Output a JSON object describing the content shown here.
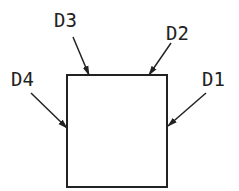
{
  "diagram": {
    "box": {
      "x": 67,
      "y": 75,
      "width": 100,
      "height": 112
    },
    "stroke_color": "#222222",
    "labels": [
      {
        "id": "D1",
        "text": "D1",
        "x": 202,
        "y": 86
      },
      {
        "id": "D2",
        "text": "D2",
        "x": 166,
        "y": 40
      },
      {
        "id": "D3",
        "text": "D3",
        "x": 54,
        "y": 27
      },
      {
        "id": "D4",
        "text": "D4",
        "x": 11,
        "y": 86
      }
    ],
    "arrows": [
      {
        "id": "D1",
        "x1": 206,
        "y1": 93,
        "x2": 168,
        "y2": 126
      },
      {
        "id": "D2",
        "x1": 171,
        "y1": 43,
        "x2": 149,
        "y2": 75
      },
      {
        "id": "D3",
        "x1": 73,
        "y1": 37,
        "x2": 89,
        "y2": 75
      },
      {
        "id": "D4",
        "x1": 31,
        "y1": 93,
        "x2": 67,
        "y2": 128
      }
    ]
  }
}
